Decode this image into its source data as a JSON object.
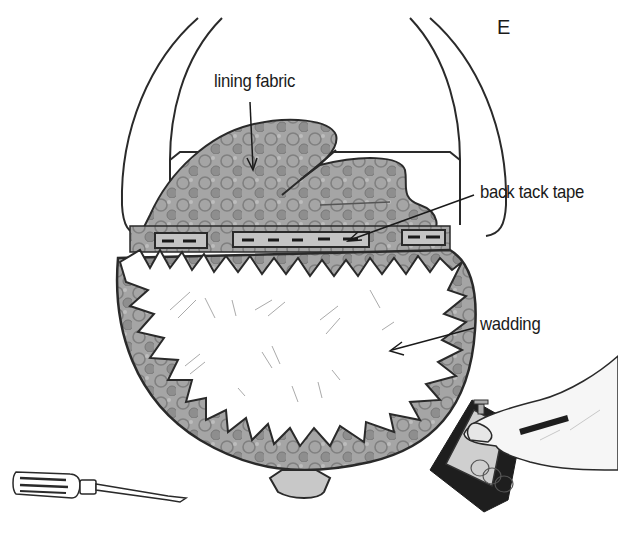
{
  "figure": {
    "step_letter": "E",
    "labels": {
      "lining_fabric": "lining fabric",
      "back_tack_tape": "back tack tape",
      "wadding": "wadding"
    },
    "elements": [
      "chair-back-frame",
      "lining-fabric",
      "back-tack-tape-strips",
      "wadding",
      "seat-fabric-edge",
      "screwdriver",
      "staple-gun-in-hand"
    ],
    "colors": {
      "line": "#2a2a2a",
      "fabric": "#9a9a9a",
      "fabric_dark": "#7a7a7a",
      "wadding": "#ffffff",
      "background": "#ffffff"
    }
  }
}
